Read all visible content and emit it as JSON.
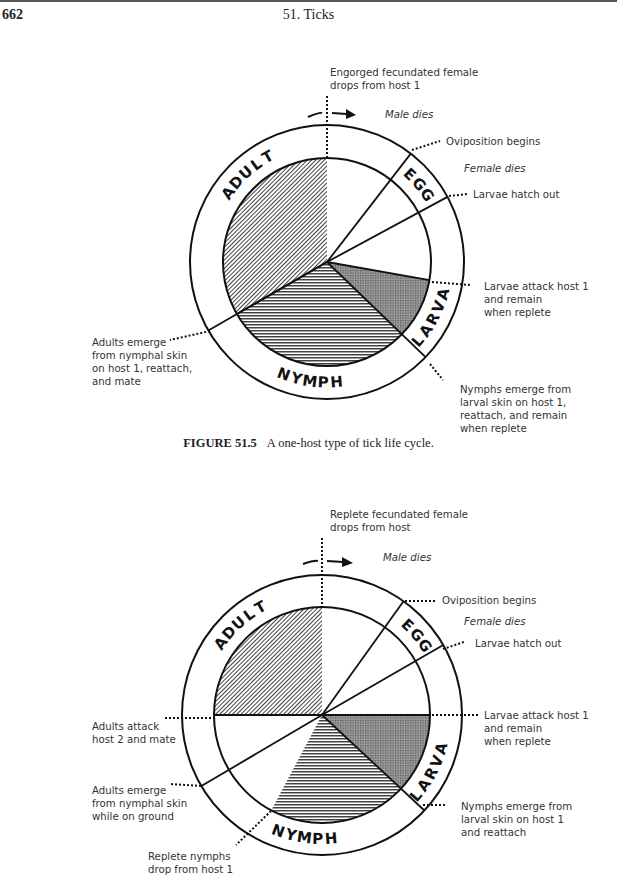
{
  "header": {
    "page_number": "662",
    "running_head": "51. Ticks"
  },
  "figure_1": {
    "caption_label": "FIGURE 51.5",
    "caption_text": "A one-host type of tick life cycle.",
    "stages": [
      "ADULT",
      "EGG",
      "LARVA",
      "NYMPH"
    ],
    "labels": {
      "top": "Engorged fecundated female\ndrops from host 1",
      "male_dies": "Male dies",
      "oviposition": "Oviposition begins",
      "female_dies": "Female dies",
      "larvae_hatch": "Larvae hatch out",
      "larvae_attack": "Larvae attack host 1\nand remain\nwhen replete",
      "nymphs_emerge": "Nymphs emerge from\nlarval skin on host 1,\nreattach, and remain\nwhen replete",
      "adults_emerge": "Adults emerge\nfrom nymphal skin\non host 1, reattach,\nand mate"
    }
  },
  "figure_2": {
    "stages": [
      "ADULT",
      "EGG",
      "LARVA",
      "NYMPH"
    ],
    "labels": {
      "top": "Replete fecundated female\ndrops from host",
      "male_dies": "Male dies",
      "oviposition": "Oviposition begins",
      "female_dies": "Female dies",
      "larvae_hatch": "Larvae hatch out",
      "larvae_attack": "Larvae attack host 1\nand remain\nwhen replete",
      "nymphs_emerge": "Nymphs emerge from\nlarval skin on host 1\nand reattach",
      "adults_attack": "Adults attack\nhost 2 and mate",
      "adults_emerge": "Adults emerge\nfrom nymphal skin\nwhile on ground",
      "nymphs_drop": "Replete nymphs\ndrop from host 1"
    }
  }
}
